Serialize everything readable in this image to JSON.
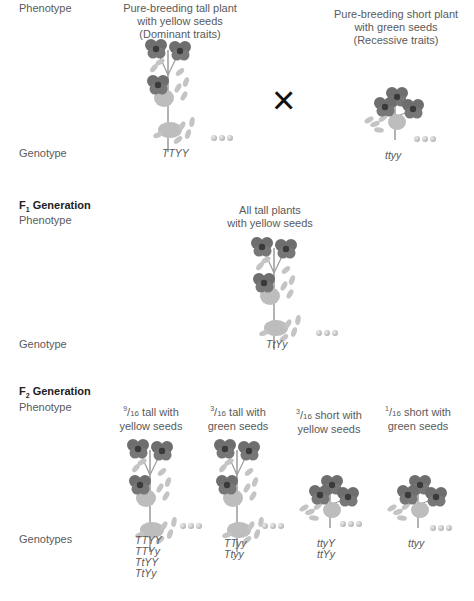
{
  "parental": {
    "phenotype_label": "Phenotype",
    "genotype_label": "Genotype",
    "cross_symbol": "×",
    "plants": [
      {
        "caption": [
          "Pure-breeding tall plant",
          "with yellow seeds",
          "(Dominant traits)"
        ],
        "genotype": "TTYY",
        "size": "tall"
      },
      {
        "caption": [
          "Pure-breeding short plant",
          "with green seeds",
          "(Recessive traits)"
        ],
        "genotype": "ttyy",
        "size": "short"
      }
    ]
  },
  "f1": {
    "title": "F",
    "title_sub": "1",
    "title_rest": " Generation",
    "phenotype_label": "Phenotype",
    "genotype_label": "Genotype",
    "caption": [
      "All tall plants",
      "with yellow seeds"
    ],
    "genotype": "TtYy"
  },
  "f2": {
    "title": "F",
    "title_sub": "2",
    "title_rest": " Generation",
    "phenotype_label": "Phenotype",
    "genotype_label": "Genotypes",
    "groups": [
      {
        "num": "9",
        "den": "16",
        "line1": " tall with",
        "line2": "yellow seeds",
        "genotypes": [
          "TTYY",
          "TTYy",
          "TtYY",
          "TtYy"
        ],
        "size": "tall"
      },
      {
        "num": "3",
        "den": "16",
        "line1": " tall with",
        "line2": "green seeds",
        "genotypes": [
          "TTyy",
          "Ttyy"
        ],
        "size": "tall"
      },
      {
        "num": "3",
        "den": "16",
        "line1": " short with",
        "line2": "yellow seeds",
        "genotypes": [
          "ttyY",
          "ttYy"
        ],
        "size": "short"
      },
      {
        "num": "1",
        "den": "16",
        "line1": " short with",
        "line2": "green seeds",
        "genotypes": [
          "ttyy"
        ],
        "size": "short"
      }
    ]
  },
  "colors": {
    "flower": "#6e6e6e",
    "flower_center": "#3a3a3a",
    "leaf": "#c4c4c4",
    "stem": "#9a9a9a"
  }
}
